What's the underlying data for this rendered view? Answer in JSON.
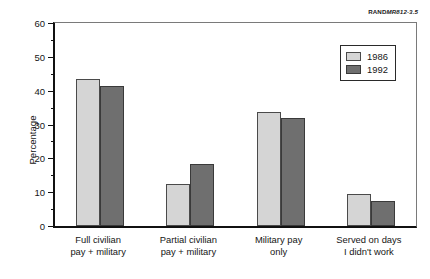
{
  "source_id": {
    "prefix": "RAND",
    "suffix": "MR812-3.5"
  },
  "legend": {
    "position": "top-right",
    "entries": [
      {
        "label": "1986",
        "swatch": "legend-swatch-1986",
        "color": "#d5d5d5"
      },
      {
        "label": "1992",
        "swatch": "legend-swatch-1992",
        "color": "#6f6f6f"
      }
    ]
  },
  "axes": {
    "y_title": "Percentage",
    "y_major_ticks": [
      "0",
      "10",
      "20",
      "30",
      "40",
      "50",
      "60"
    ],
    "y_minor_ticks": [
      "5",
      "15",
      "25",
      "35",
      "45",
      "55"
    ]
  },
  "chart_data": {
    "type": "bar",
    "title": "",
    "xlabel": "",
    "ylabel": "Percentage",
    "ylim": [
      0,
      60
    ],
    "ytick_interval": 10,
    "yminor_tick_interval": 5,
    "grid": false,
    "legend_position": "top-right",
    "categories": [
      "Full civilian\npay + military",
      "Partial civilian\npay + military",
      "Military pay\nonly",
      "Served on days\nI didn't work"
    ],
    "series": [
      {
        "name": "1986",
        "color": "#d5d5d5",
        "values": [
          43.5,
          12.4,
          33.7,
          9.5
        ]
      },
      {
        "name": "1992",
        "color": "#6f6f6f",
        "values": [
          41.3,
          18.2,
          32.0,
          7.3
        ]
      }
    ]
  }
}
